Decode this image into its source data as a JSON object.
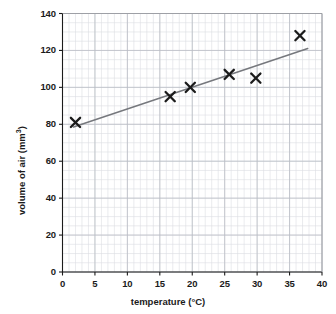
{
  "chart_data": {
    "type": "scatter",
    "title": "",
    "xlabel": "temperature (°C)",
    "ylabel": "volume of air (mm3)",
    "ylabel_base": "volume of air (mm",
    "ylabel_sup": "3",
    "ylabel_tail": ")",
    "xlim": [
      0,
      40
    ],
    "ylim": [
      0,
      140
    ],
    "xticks": [
      0,
      5,
      10,
      15,
      20,
      25,
      30,
      35,
      40
    ],
    "yticks": [
      0,
      20,
      40,
      60,
      80,
      100,
      120,
      140
    ],
    "xtick_labels": [
      "0",
      "5",
      "10",
      "15",
      "20",
      "25",
      "30",
      "35",
      "40"
    ],
    "ytick_labels": [
      "0",
      "20",
      "40",
      "60",
      "80",
      "100",
      "120",
      "140"
    ],
    "x_minor_step": 1,
    "y_minor_step": 5,
    "grid": true,
    "grid_color": "#b9bcc4",
    "minor_grid_color": "#dcdee3",
    "legend": "none",
    "marker": "x-cross",
    "marker_color": "#1b1b1b",
    "points": [
      {
        "x": 2.0,
        "y": 81
      },
      {
        "x": 16.6,
        "y": 95
      },
      {
        "x": 19.7,
        "y": 100
      },
      {
        "x": 25.7,
        "y": 107
      },
      {
        "x": 29.8,
        "y": 105
      },
      {
        "x": 36.6,
        "y": 128
      }
    ],
    "series": [
      {
        "name": "volume of air",
        "x": [
          2.0,
          16.6,
          19.7,
          25.7,
          29.8,
          36.6
        ],
        "values": [
          81,
          95,
          100,
          107,
          105,
          128
        ]
      }
    ],
    "trendline": {
      "type": "line-of-best-fit",
      "color": "#76787d",
      "x_start": 1.7,
      "y_start": 78.5,
      "x_end": 37.8,
      "y_end": 121.0
    }
  }
}
